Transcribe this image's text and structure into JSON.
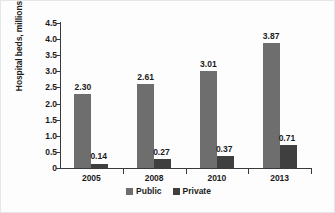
{
  "chart_data": {
    "type": "bar",
    "title": "",
    "subtitle": "",
    "xlabel": "",
    "ylabel": "Hospital beds, millions",
    "categories": [
      "2005",
      "2008",
      "2010",
      "2013"
    ],
    "series": [
      {
        "name": "Public",
        "color": "#6e6e6e",
        "values": [
          2.3,
          2.61,
          3.01,
          3.87
        ],
        "labels": [
          "2.30",
          "2.61",
          "3.01",
          "3.87"
        ]
      },
      {
        "name": "Private",
        "color": "#3f3f3f",
        "values": [
          0.14,
          0.27,
          0.37,
          0.71
        ],
        "labels": [
          "0.14",
          "0.27",
          "0.37",
          "0.71"
        ]
      }
    ],
    "ylim": [
      0,
      4.5
    ],
    "yticks": [
      4.5,
      4.0,
      3.5,
      3.0,
      2.5,
      2.0,
      1.5,
      1.0,
      0.5,
      0
    ],
    "ytick_labels": [
      "4.5",
      "4.0",
      "3.5",
      "3.0",
      "2.5",
      "2.0",
      "1.5",
      "1.0",
      "0.5",
      "0"
    ],
    "grid": false,
    "legend_position": "bottom",
    "legend": [
      "Public",
      "Private"
    ]
  }
}
